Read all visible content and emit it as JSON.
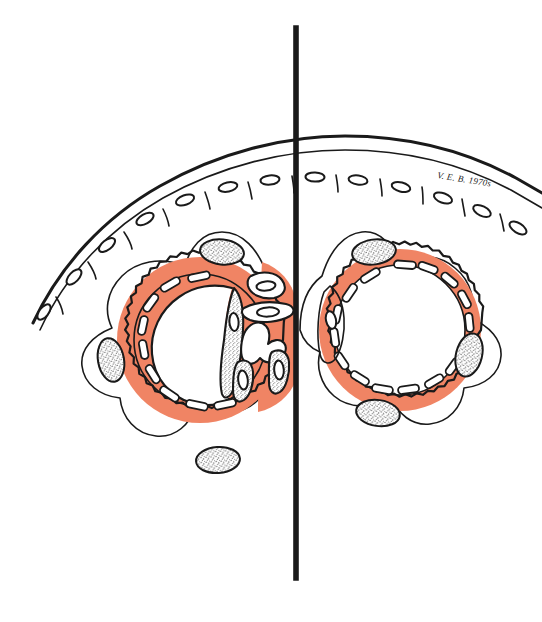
{
  "figure": {
    "medium": "hand-drawn ink and colour-wash scientific illustration",
    "background_color": "#ffffff",
    "canvas": {
      "width": 542,
      "height": 622
    }
  },
  "palette": {
    "ink": "#1a1a1a",
    "wash_salmon": "#F08464",
    "wash_salmon_light": "#F59E80",
    "paper_white": "#ffffff",
    "stipple_grey": "#2b2b2b"
  },
  "divider": {
    "label": "midline-divider",
    "orientation": "vertical",
    "x": 296,
    "y_top": 28,
    "y_bottom": 578,
    "stroke_width": 5.6,
    "color": "#1a1a1a"
  },
  "epithelium": {
    "label": "surface epithelial sheet",
    "description": "single arched row of flattened squamous-like cells with oval nuclei spanning the upper portion of the figure",
    "cell_count_visible": 14,
    "stroke_color": "#1a1a1a"
  },
  "structures": [
    {
      "id": "left-section",
      "label": "left half-section",
      "side": "left",
      "ring": {
        "label": "scalloped capsule ring",
        "outer_edge": "crenellated / scalloped",
        "inner_lining": "dashed broken lining",
        "fill_color": "#F08464"
      },
      "lumen_state": "occluded",
      "lumen_description": "lumen crowded with branching cellular cords and salmon-stained matrix; narrow residual crescent-shaped cavity remains at the left",
      "peripheral_nuclei_count": 3,
      "internal_nuclei_count": 6
    },
    {
      "id": "right-section",
      "label": "right half-section",
      "side": "right",
      "ring": {
        "label": "scalloped capsule ring",
        "outer_edge": "crenellated / scalloped",
        "inner_lining": "dashed broken lining",
        "fill_color": "#F08464"
      },
      "lumen_state": "patent",
      "lumen_description": "wide open round lumen, clear of contents; ring wall evenly stained salmon",
      "peripheral_nuclei_count": 3,
      "internal_nuclei_count": 1
    }
  ],
  "annotations": {
    "signature": {
      "label": "artist signature",
      "text": "V. E. B. 1970s",
      "position": "upper right, above epithelial line",
      "style": "handwritten cursive"
    }
  }
}
